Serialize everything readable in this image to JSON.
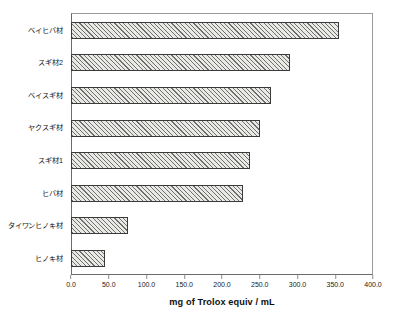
{
  "chart_data": {
    "type": "bar",
    "orientation": "horizontal",
    "title": "",
    "xlabel": "mg of Trolox equiv / mL",
    "ylabel": "",
    "xlim": [
      0,
      400
    ],
    "ylim": null,
    "grid": false,
    "legend": null,
    "xticks": [
      "0.0",
      "50.0",
      "100.0",
      "150.0",
      "200.0",
      "250.0",
      "300.0",
      "350.0",
      "400.0"
    ],
    "xtick_values": [
      0,
      50,
      100,
      150,
      200,
      250,
      300,
      350,
      400
    ],
    "categories": [
      "ベイヒバ材",
      "スギ材2",
      "ベイスギ材",
      "ヤクスギ材",
      "スギ材1",
      "ヒバ材",
      "タイワンヒノキ材",
      "ヒノキ材"
    ],
    "values": [
      355,
      290,
      265,
      250,
      237,
      228,
      75,
      45
    ],
    "bar_fill": "#e9e9e6",
    "bar_hatch": "diagonal-crosshatch",
    "bar_edge_color": "#3a3a3a",
    "axis_color": "#6b6b6b",
    "background": "#ffffff"
  },
  "axis_title": {
    "text": "mg of Trolox equiv / mL"
  }
}
